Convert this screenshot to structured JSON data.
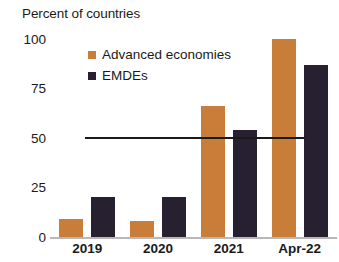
{
  "chart_data": {
    "type": "bar",
    "title": "Percent of countries",
    "subtitle": "",
    "xlabel": "",
    "ylabel": "",
    "categories": [
      "2019",
      "2020",
      "2021",
      "Apr-22"
    ],
    "series": [
      {
        "name": "Advanced economies",
        "color": "#c87e38",
        "values": [
          9,
          8,
          66,
          100
        ]
      },
      {
        "name": "EMDEs",
        "color": "#272031",
        "values": [
          20,
          20,
          54,
          87
        ]
      }
    ],
    "ylim": [
      0,
      100
    ],
    "yticks": [
      0,
      25,
      50,
      75,
      100
    ],
    "ytick_labels": [
      "0",
      "25",
      "50",
      "75",
      "100"
    ],
    "grid": false,
    "legend_position": "top-left-inside",
    "annotations": [
      {
        "type": "reference-line",
        "orientation": "horizontal",
        "value": 50,
        "color": "#1a1a1a",
        "label": ""
      }
    ]
  },
  "axis": {
    "baseline_color": "#b8b8b8"
  }
}
